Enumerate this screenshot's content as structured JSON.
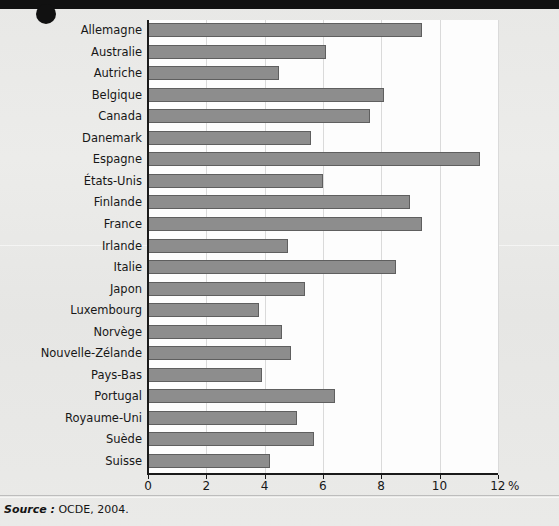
{
  "chart_data": {
    "type": "bar",
    "orientation": "horizontal",
    "title": "",
    "xlabel": "%",
    "ylabel": "",
    "xlim": [
      0,
      12
    ],
    "xticks": [
      0,
      2,
      4,
      6,
      8,
      10,
      12
    ],
    "xtick_labels": [
      "0",
      "2",
      "4",
      "6",
      "8",
      "10",
      "12"
    ],
    "grid": true,
    "grid_axis": "x",
    "legend": false,
    "bar_color": "#8d8d8d",
    "bar_edge_color": "#5f5f5f",
    "categories": [
      "Allemagne",
      "Australie",
      "Autriche",
      "Belgique",
      "Canada",
      "Danemark",
      "Espagne",
      "États-Unis",
      "Finlande",
      "France",
      "Irlande",
      "Italie",
      "Japon",
      "Luxembourg",
      "Norvège",
      "Nouvelle-Zélande",
      "Pays-Bas",
      "Portugal",
      "Royaume-Uni",
      "Suède",
      "Suisse"
    ],
    "values": [
      9.4,
      6.1,
      4.5,
      8.1,
      7.6,
      5.6,
      11.4,
      6.0,
      9.0,
      9.4,
      4.8,
      8.5,
      5.4,
      3.8,
      4.6,
      4.9,
      3.9,
      6.4,
      5.1,
      5.7,
      4.2
    ]
  },
  "footer": {
    "source_label": "Source :",
    "source_text": "OCDE, 2004."
  },
  "axis": {
    "unit": "%"
  }
}
